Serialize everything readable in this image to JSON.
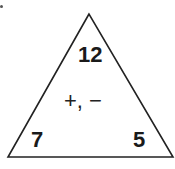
{
  "diagram": {
    "type": "fact-family-triangle",
    "top_number": "12",
    "bottom_left_number": "7",
    "bottom_right_number": "5",
    "operations": "+, −",
    "stroke_color": "#222222",
    "text_color": "#1a1a1a"
  }
}
